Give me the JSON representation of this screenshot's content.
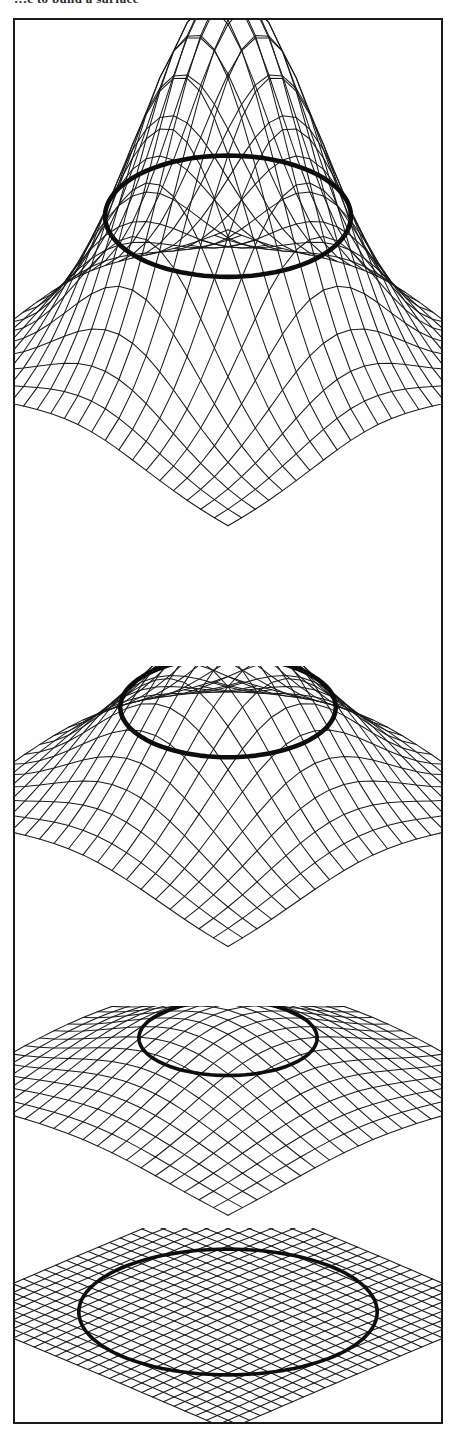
{
  "page": {
    "clipped_header_text": "…e to build a surface",
    "frame": {
      "border_color": "#1a1a1a",
      "background": "#fefefe"
    },
    "ink_color": "#1b1b1b",
    "contour_color": "#0d0d0d"
  },
  "figure": {
    "caption": "",
    "panel_count": 4
  },
  "chart_data": [
    {
      "type": "surface",
      "panel": 1,
      "title": "",
      "xlabel": "",
      "ylabel": "",
      "zlabel": "",
      "surface": "gaussian-bump",
      "peak_height": 1.0,
      "bump_sigma": 0.22,
      "grid": {
        "nx": 22,
        "ny": 22
      },
      "contour_level": 0.42,
      "contour_visible": true,
      "view": {
        "elevation_deg": 22,
        "azimuth_deg": 40
      },
      "notes": "Tallest, sharpest peak; contour ellipse sits about 40% up the peak."
    },
    {
      "type": "surface",
      "panel": 2,
      "title": "",
      "xlabel": "",
      "ylabel": "",
      "zlabel": "",
      "surface": "gaussian-bump",
      "peak_height": 0.55,
      "bump_sigma": 0.26,
      "grid": {
        "nx": 20,
        "ny": 20
      },
      "contour_level": 0.33,
      "contour_visible": true,
      "view": {
        "elevation_deg": 26,
        "azimuth_deg": 40
      },
      "notes": "Medium height, broader dome; contour ellipse crosses near mid-dome."
    },
    {
      "type": "surface",
      "panel": 3,
      "title": "",
      "xlabel": "",
      "ylabel": "",
      "zlabel": "",
      "surface": "gaussian-bump",
      "peak_height": 0.26,
      "bump_sigma": 0.3,
      "grid": {
        "nx": 20,
        "ny": 20
      },
      "contour_level": 0.2,
      "contour_visible": true,
      "view": {
        "elevation_deg": 30,
        "azimuth_deg": 40
      },
      "notes": "Low, gentle mound; contour loop near the crest."
    },
    {
      "type": "surface",
      "panel": 4,
      "title": "",
      "xlabel": "",
      "ylabel": "",
      "zlabel": "",
      "surface": "flat-plane",
      "peak_height": 0.02,
      "bump_sigma": 0.32,
      "grid": {
        "nx": 26,
        "ny": 26
      },
      "contour_level": 0.01,
      "contour_visible": true,
      "view": {
        "elevation_deg": 34,
        "azimuth_deg": 40
      },
      "notes": "Essentially flat plane with dense mesh; contour is a closed loop drawn on the plane."
    }
  ]
}
